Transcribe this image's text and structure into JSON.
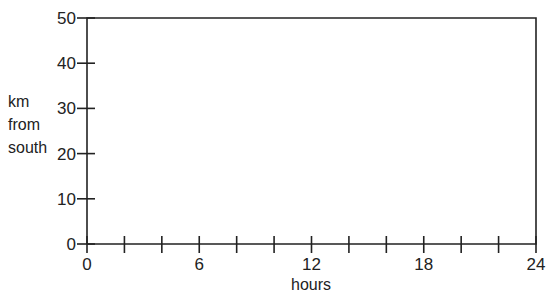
{
  "chart_data": {
    "type": "line",
    "title": "",
    "xlabel": "hours",
    "ylabel": [
      "km",
      "from",
      "south"
    ],
    "xlim": [
      0,
      24
    ],
    "ylim": [
      0,
      50
    ],
    "x_ticks": [
      0,
      2,
      4,
      6,
      8,
      10,
      12,
      14,
      16,
      18,
      20,
      22,
      24
    ],
    "x_tick_labels": [
      "0",
      "6",
      "12",
      "18",
      "24"
    ],
    "x_labeled_values": [
      0,
      6,
      12,
      18,
      24
    ],
    "y_ticks": [
      0,
      10,
      20,
      30,
      40,
      50
    ],
    "y_tick_labels": [
      "0",
      "10",
      "20",
      "30",
      "40",
      "50"
    ],
    "grid": false,
    "legend": null,
    "series": []
  }
}
